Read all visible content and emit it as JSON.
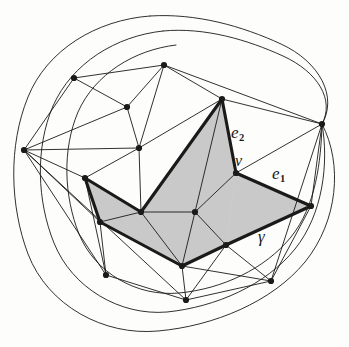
{
  "figure": {
    "kind": "mathematical-diagram",
    "background_color": "#fdfdfc",
    "line_color": "#1a1a1a",
    "shade_color": "#c9c9c9",
    "bold_stroke_width": 3.1,
    "thin_stroke_width": 0.9
  },
  "labels": {
    "e2": {
      "text": "e",
      "sub": "2",
      "x": 231,
      "y": 124
    },
    "e1": {
      "text": "e",
      "sub": "1",
      "x": 272,
      "y": 165
    },
    "v": {
      "text": "v",
      "x": 235,
      "y": 153
    },
    "gamma": {
      "text": "γ",
      "x": 258,
      "y": 228
    }
  },
  "geometry": {
    "outer_curves": [
      "M 150,16 C 96,20 47,50 28,97 C 8,146 10,206 28,254 C 48,306 104,336 158,331 C 214,326 272,302 305,262 C 338,221 343,164 322,124",
      "M 322,124 C 338,97 320,62 281,44 C 242,26 196,13 150,16",
      "M 163,31 C 116,36 72,63 53,106 C 35,148 37,201 54,243 C 72,288 120,316 167,312 C 216,307 266,285 295,249 C 323,214 329,163 322,124",
      "M 322,124 C 335,100 318,72 283,56 C 248,40 205,27 163,31",
      "M 176,45 C 134,50 95,74 78,112 C 62,150 64,196 79,234 C 95,273 137,297 179,293 C 222,289 265,269 291,237 C 316,206 321,161 322,124"
    ],
    "vertices": [
      {
        "id": "L",
        "x": 24,
        "y": 150
      },
      {
        "id": "TL",
        "x": 74,
        "y": 78
      },
      {
        "id": "T",
        "x": 164,
        "y": 65
      },
      {
        "id": "M1",
        "x": 127,
        "y": 107
      },
      {
        "id": "C",
        "x": 139,
        "y": 148
      },
      {
        "id": "A",
        "x": 222,
        "y": 99
      },
      {
        "id": "R",
        "x": 322,
        "y": 124
      },
      {
        "id": "V",
        "x": 236,
        "y": 173
      },
      {
        "id": "P",
        "x": 85,
        "y": 178
      },
      {
        "id": "Q",
        "x": 100,
        "y": 222
      },
      {
        "id": "K",
        "x": 141,
        "y": 212
      },
      {
        "id": "N",
        "x": 195,
        "y": 212
      },
      {
        "id": "E",
        "x": 311,
        "y": 206
      },
      {
        "id": "S",
        "x": 226,
        "y": 245
      },
      {
        "id": "B",
        "x": 182,
        "y": 266
      },
      {
        "id": "BL",
        "x": 106,
        "y": 275
      },
      {
        "id": "BC",
        "x": 186,
        "y": 300
      },
      {
        "id": "BR",
        "x": 271,
        "y": 281
      }
    ],
    "thin_edges": [
      [
        "L",
        "TL"
      ],
      [
        "L",
        "M1"
      ],
      [
        "L",
        "C"
      ],
      [
        "L",
        "P"
      ],
      [
        "L",
        "Q"
      ],
      [
        "L",
        "BL"
      ],
      [
        "L",
        "BC"
      ],
      [
        "TL",
        "T"
      ],
      [
        "TL",
        "M1"
      ],
      [
        "M1",
        "T"
      ],
      [
        "M1",
        "C"
      ],
      [
        "T",
        "C"
      ],
      [
        "T",
        "A"
      ],
      [
        "T",
        "R"
      ],
      [
        "C",
        "A"
      ],
      [
        "C",
        "K"
      ],
      [
        "C",
        "P"
      ],
      [
        "A",
        "R"
      ],
      [
        "A",
        "N"
      ],
      [
        "A",
        "V"
      ],
      [
        "R",
        "V"
      ],
      [
        "R",
        "E"
      ],
      [
        "R",
        "BR"
      ],
      [
        "V",
        "N"
      ],
      [
        "N",
        "K"
      ],
      [
        "N",
        "S"
      ],
      [
        "K",
        "Q"
      ],
      [
        "K",
        "B"
      ],
      [
        "E",
        "S"
      ],
      [
        "E",
        "BR"
      ],
      [
        "S",
        "BR"
      ],
      [
        "S",
        "BC"
      ],
      [
        "B",
        "BC"
      ],
      [
        "B",
        "BR"
      ],
      [
        "Q",
        "BL"
      ],
      [
        "P",
        "BL"
      ],
      [
        "BL",
        "BC"
      ],
      [
        "BC",
        "BR"
      ],
      [
        "S",
        "B"
      ],
      [
        "P",
        "Q"
      ],
      [
        "N",
        "B"
      ]
    ],
    "bold_path": [
      [
        "P",
        "Q"
      ],
      [
        "Q",
        "B"
      ],
      [
        "B",
        "S"
      ],
      [
        "S",
        "E"
      ],
      [
        "E",
        "V"
      ],
      [
        "V",
        "A"
      ],
      [
        "A",
        "K"
      ],
      [
        "K",
        "P"
      ]
    ],
    "shaded_triangles": [
      [
        "P",
        "Q",
        "K"
      ],
      [
        "Q",
        "B",
        "K"
      ],
      [
        "K",
        "B",
        "N"
      ],
      [
        "B",
        "S",
        "N"
      ],
      [
        "K",
        "N",
        "A"
      ],
      [
        "A",
        "N",
        "V"
      ],
      [
        "N",
        "S",
        "V"
      ],
      [
        "S",
        "E",
        "V"
      ]
    ]
  }
}
